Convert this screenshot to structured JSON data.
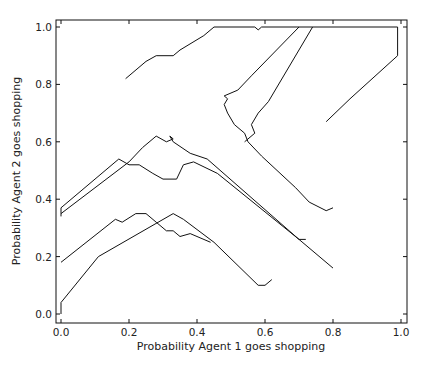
{
  "chart_data": {
    "type": "line",
    "title": "",
    "xlabel": "Probability Agent 1 goes shopping",
    "ylabel": "Probability Agent 2 goes shopping",
    "xlim": [
      -0.015,
      1.015
    ],
    "ylim": [
      -0.03,
      1.025
    ],
    "xticks": [
      "0.0",
      "0.2",
      "0.4",
      "0.6",
      "0.8",
      "1.0"
    ],
    "yticks": [
      "0.0",
      "0.2",
      "0.4",
      "0.6",
      "0.8",
      "1.0"
    ],
    "grid": false,
    "legend": null,
    "line_color": "#111111",
    "series": [
      {
        "name": "trajectory-1",
        "points": [
          [
            0.0,
            0.0
          ],
          [
            0.0,
            0.04
          ],
          [
            0.11,
            0.2
          ],
          [
            0.33,
            0.35
          ],
          [
            0.36,
            0.33
          ],
          [
            0.45,
            0.25
          ],
          [
            0.58,
            0.1
          ],
          [
            0.6,
            0.1
          ],
          [
            0.62,
            0.12
          ]
        ]
      },
      {
        "name": "trajectory-2",
        "points": [
          [
            0.0,
            0.18
          ],
          [
            0.16,
            0.33
          ],
          [
            0.18,
            0.32
          ],
          [
            0.22,
            0.35
          ],
          [
            0.25,
            0.35
          ],
          [
            0.28,
            0.32
          ],
          [
            0.31,
            0.29
          ],
          [
            0.33,
            0.29
          ],
          [
            0.35,
            0.27
          ],
          [
            0.38,
            0.28
          ],
          [
            0.44,
            0.25
          ]
        ]
      },
      {
        "name": "trajectory-3",
        "points": [
          [
            0.0,
            0.34
          ],
          [
            0.0,
            0.37
          ],
          [
            0.17,
            0.54
          ],
          [
            0.2,
            0.52
          ],
          [
            0.23,
            0.52
          ],
          [
            0.27,
            0.49
          ],
          [
            0.3,
            0.47
          ],
          [
            0.34,
            0.47
          ],
          [
            0.36,
            0.52
          ],
          [
            0.39,
            0.53
          ],
          [
            0.46,
            0.49
          ],
          [
            0.7,
            0.26
          ],
          [
            0.72,
            0.26
          ]
        ]
      },
      {
        "name": "trajectory-4",
        "points": [
          [
            0.0,
            0.35
          ],
          [
            0.2,
            0.53
          ],
          [
            0.24,
            0.58
          ],
          [
            0.28,
            0.62
          ],
          [
            0.31,
            0.6
          ],
          [
            0.33,
            0.61
          ],
          [
            0.32,
            0.62
          ],
          [
            0.33,
            0.6
          ],
          [
            0.38,
            0.56
          ],
          [
            0.43,
            0.54
          ],
          [
            0.7,
            0.26
          ],
          [
            0.8,
            0.16
          ]
        ]
      },
      {
        "name": "trajectory-5",
        "points": [
          [
            0.19,
            0.82
          ],
          [
            0.25,
            0.88
          ],
          [
            0.28,
            0.9
          ],
          [
            0.3,
            0.9
          ],
          [
            0.33,
            0.9
          ],
          [
            0.35,
            0.92
          ],
          [
            0.42,
            0.97
          ],
          [
            0.45,
            1.0
          ],
          [
            0.57,
            1.0
          ],
          [
            0.58,
            0.99
          ],
          [
            0.59,
            1.0
          ],
          [
            0.99,
            1.0
          ],
          [
            0.99,
            0.9
          ],
          [
            0.85,
            0.75
          ],
          [
            0.78,
            0.67
          ]
        ]
      },
      {
        "name": "trajectory-6",
        "points": [
          [
            0.48,
            0.76
          ],
          [
            0.49,
            0.75
          ],
          [
            0.48,
            0.73
          ],
          [
            0.49,
            0.7
          ],
          [
            0.51,
            0.66
          ],
          [
            0.54,
            0.63
          ],
          [
            0.55,
            0.6
          ],
          [
            0.59,
            0.55
          ],
          [
            0.69,
            0.44
          ],
          [
            0.73,
            0.39
          ],
          [
            0.78,
            0.36
          ],
          [
            0.8,
            0.37
          ]
        ]
      },
      {
        "name": "trajectory-7",
        "points": [
          [
            0.48,
            0.76
          ],
          [
            0.52,
            0.78
          ],
          [
            0.56,
            0.83
          ],
          [
            0.7,
            1.0
          ]
        ]
      },
      {
        "name": "trajectory-8",
        "points": [
          [
            0.54,
            0.6
          ],
          [
            0.57,
            0.63
          ],
          [
            0.56,
            0.66
          ],
          [
            0.58,
            0.7
          ],
          [
            0.61,
            0.74
          ],
          [
            0.74,
            1.0
          ]
        ]
      }
    ]
  }
}
